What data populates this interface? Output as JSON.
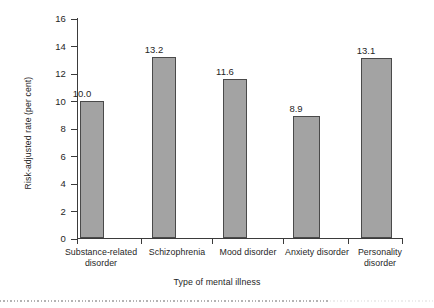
{
  "chart_data": {
    "type": "bar",
    "title": "",
    "subtitle": "",
    "xlabel": "Type of mental illness",
    "ylabel": "Risk-adjusted rate (per cent)",
    "categories": [
      "Substance-related disorder",
      "Schizophrenia",
      "Mood disorder",
      "Anxiety disorder",
      "Personality disorder"
    ],
    "category_lines": [
      [
        "Substance-related",
        "disorder"
      ],
      [
        "Schizophrenia"
      ],
      [
        "Mood disorder"
      ],
      [
        "Anxiety disorder"
      ],
      [
        "Personality",
        "disorder"
      ]
    ],
    "values": [
      10.0,
      13.2,
      11.6,
      8.9,
      13.1
    ],
    "value_labels": [
      "10.0",
      "13.2",
      "11.6",
      "8.9",
      "13.1"
    ],
    "ylim": [
      0,
      16
    ],
    "ytick_labels": [
      "0",
      "2",
      "4",
      "6",
      "8",
      "10",
      "12",
      "14",
      "16"
    ],
    "ytick_values": [
      0,
      2,
      4,
      6,
      8,
      10,
      12,
      14,
      16
    ],
    "grid": false,
    "legend": null,
    "legend_position": "none",
    "bar_fill_color": "#a3a3a3",
    "bar_edge_color": "#4a4a4a",
    "axis_color": "#3b3b3b",
    "text_color": "#262626",
    "background_color": "#ffffff"
  }
}
